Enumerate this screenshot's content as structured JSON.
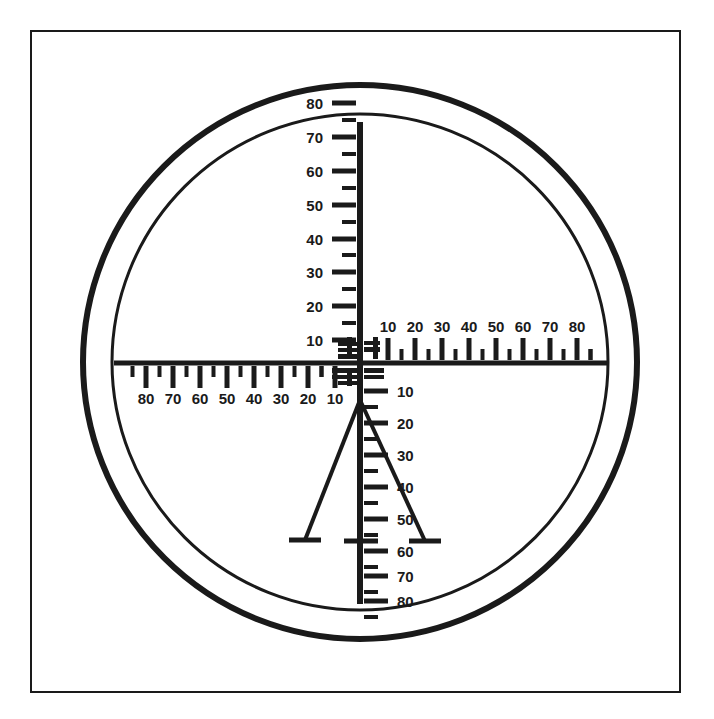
{
  "figure": {
    "background_color": "#ffffff",
    "ink_color": "#1a1a1a"
  },
  "frame": {
    "name": "border-frame",
    "x": 31,
    "y": 31,
    "width": 649,
    "height": 661,
    "stroke_width": 2
  },
  "field_of_view": {
    "center_x": 360,
    "center_y": 362,
    "outer_circle_radius": 277,
    "outer_circle_stroke": 6,
    "inner_circle_radius": 248,
    "inner_circle_stroke": 3
  },
  "crosshair": {
    "vertical": {
      "x": 360,
      "y_top": 122,
      "y_bottom": 604,
      "stroke": 6
    },
    "horizontal": {
      "y": 363,
      "x_left": 114,
      "x_right": 608,
      "stroke": 5
    },
    "base_bar": {
      "y": 541,
      "x_left": 344,
      "x_right": 378,
      "stroke": 5
    }
  },
  "scales": {
    "top_vertical": {
      "name": "top-vertical-scale",
      "orientation": "vertical-up",
      "labels": [
        "10",
        "20",
        "30",
        "40",
        "50",
        "60",
        "70",
        "80"
      ],
      "label_y": [
        340,
        306,
        272,
        239,
        205,
        171,
        137,
        103
      ],
      "major_tick_length": 24,
      "minor_tick_length": 14,
      "tick_side": "left",
      "minor_count": 8
    },
    "bottom_vertical": {
      "name": "bottom-vertical-scale",
      "orientation": "vertical-down",
      "labels": [
        "10",
        "20",
        "30",
        "40",
        "50",
        "60",
        "70",
        "80"
      ],
      "label_y": [
        391,
        423,
        455,
        487,
        519,
        551,
        576,
        601
      ],
      "major_tick_length": 24,
      "minor_tick_length": 14,
      "tick_side": "right",
      "minor_count": 8
    },
    "right_horizontal": {
      "name": "right-horizontal-scale",
      "orientation": "horizontal-right",
      "labels": [
        "10",
        "20",
        "30",
        "40",
        "50",
        "60",
        "70",
        "80"
      ],
      "label_x": [
        388,
        415,
        442,
        469,
        496,
        523,
        550,
        577
      ],
      "major_tick_length": 22,
      "minor_tick_length": 11,
      "tick_side": "above",
      "minor_count": 8
    },
    "left_horizontal": {
      "name": "left-horizontal-scale",
      "orientation": "horizontal-left",
      "labels": [
        "80",
        "70",
        "60",
        "50",
        "40",
        "30",
        "20",
        "10"
      ],
      "label_x": [
        146,
        173,
        200,
        227,
        254,
        281,
        308,
        335
      ],
      "major_tick_length": 22,
      "minor_tick_length": 11,
      "tick_side": "below",
      "minor_count": 8
    }
  },
  "stadia_lines": {
    "name": "stadia-rangefinder-lines",
    "apex_x": 360,
    "apex_y": 400,
    "left_line": {
      "x2": 305,
      "y2": 540,
      "foot_half_width": 16
    },
    "right_line": {
      "x2": 425,
      "y2": 541,
      "foot_half_width": 16
    },
    "stroke": 4
  },
  "center_cluster": {
    "name": "center-fine-graduation-cluster",
    "description": "dense blocky fine graduations around the crosshair intersection",
    "bars": [
      {
        "x": 338,
        "y": 342,
        "w": 21,
        "h": 4
      },
      {
        "x": 338,
        "y": 348,
        "w": 21,
        "h": 4
      },
      {
        "x": 338,
        "y": 354,
        "w": 21,
        "h": 5
      },
      {
        "x": 332,
        "y": 368,
        "w": 27,
        "h": 5
      },
      {
        "x": 332,
        "y": 375,
        "w": 27,
        "h": 4
      },
      {
        "x": 338,
        "y": 381,
        "w": 21,
        "h": 4
      },
      {
        "x": 364,
        "y": 341,
        "w": 16,
        "h": 4
      },
      {
        "x": 364,
        "y": 347,
        "w": 16,
        "h": 5
      },
      {
        "x": 364,
        "y": 368,
        "w": 20,
        "h": 5
      },
      {
        "x": 364,
        "y": 375,
        "w": 20,
        "h": 4
      },
      {
        "x": 373,
        "y": 337,
        "w": 5,
        "h": 22
      },
      {
        "x": 347,
        "y": 337,
        "w": 5,
        "h": 22
      },
      {
        "x": 347,
        "y": 368,
        "w": 5,
        "h": 18
      }
    ]
  }
}
